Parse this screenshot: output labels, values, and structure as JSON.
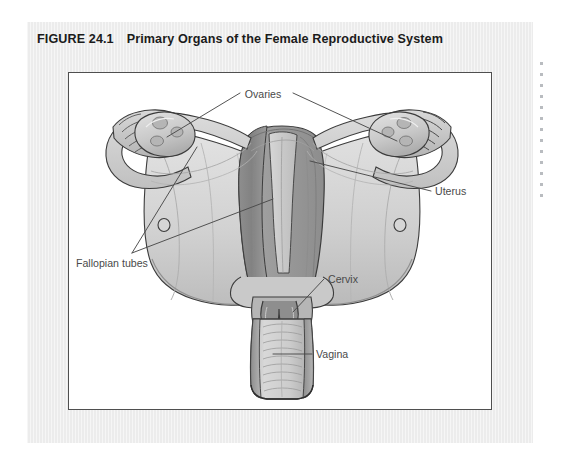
{
  "figure": {
    "number": "FIGURE 24.1",
    "title": "Primary Organs of the Female Reproductive System"
  },
  "illustration": {
    "subject": "female-reproductive-system-anatomy",
    "view": "posterior coronal section",
    "labels": [
      {
        "id": "ovaries",
        "text": "Ovaries",
        "x": 262,
        "y": 94,
        "anchor": "middle"
      },
      {
        "id": "uterus",
        "text": "Uterus",
        "x": 434,
        "y": 190,
        "anchor": "start"
      },
      {
        "id": "fallopian-tubes",
        "text": "Fallopian tubes",
        "x": 75,
        "y": 262,
        "anchor": "start"
      },
      {
        "id": "cervix",
        "text": "Cervix",
        "x": 327,
        "y": 278,
        "anchor": "start"
      },
      {
        "id": "vagina",
        "text": "Vagina",
        "x": 315,
        "y": 353,
        "anchor": "start"
      }
    ]
  },
  "colors": {
    "page_background": "#ffffff",
    "paper": "#ececec",
    "art_background": "#ffffff",
    "art_border": "#4f4f4f",
    "caption_text": "#1b1b1b",
    "label_text": "#4a4a4a",
    "leader_line": "#4a4a4a",
    "outline": "#3c3c3c",
    "tissue_light": "#dcdcdc",
    "tissue_mid": "#c3c3c3",
    "tissue_dark": "#9a9a9a",
    "tissue_darkest": "#7c7c7c",
    "margin_dots": "#b9bcc0"
  }
}
